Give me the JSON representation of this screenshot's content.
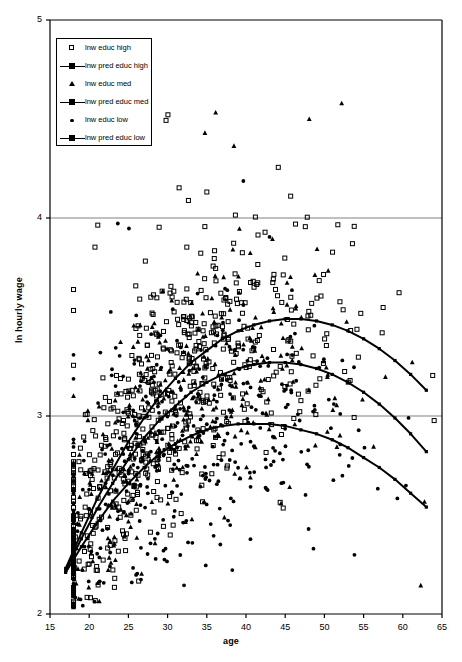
{
  "chart_data": {
    "type": "scatter",
    "title": "",
    "xlabel": "age",
    "ylabel": "ln hourly wage",
    "xlim": [
      15,
      65
    ],
    "ylim": [
      2,
      5
    ],
    "xticks": [
      15,
      20,
      25,
      30,
      35,
      40,
      45,
      50,
      55,
      60,
      65
    ],
    "yticks": [
      2,
      3,
      4,
      5
    ],
    "grid": "horizontal",
    "gridlines_y": [
      3,
      4
    ],
    "legend_position": "top-left",
    "legend": [
      {
        "label": "lnw educ high",
        "marker": "open-square",
        "type": "scatter"
      },
      {
        "label": "lnw pred educ high",
        "marker": "line-square",
        "type": "line"
      },
      {
        "label": "lnw educ med",
        "marker": "filled-triangle",
        "type": "scatter"
      },
      {
        "label": "lnw pred educ med",
        "marker": "line-square",
        "type": "line"
      },
      {
        "label": "lnw educ low",
        "marker": "filled-circle",
        "type": "scatter"
      },
      {
        "label": "lnw pred educ low",
        "marker": "line-square",
        "type": "line"
      }
    ],
    "series": [
      {
        "name": "lnw pred educ high",
        "type": "line",
        "x": [
          17,
          19,
          21,
          23,
          25,
          27,
          29,
          31,
          33,
          35,
          37,
          39,
          41,
          43,
          45,
          47,
          49,
          51,
          53,
          55,
          57,
          59,
          61,
          63
        ],
        "y": [
          2.23,
          2.41,
          2.58,
          2.73,
          2.87,
          2.99,
          3.1,
          3.19,
          3.27,
          3.33,
          3.39,
          3.43,
          3.46,
          3.48,
          3.49,
          3.49,
          3.48,
          3.46,
          3.43,
          3.39,
          3.34,
          3.28,
          3.21,
          3.13
        ]
      },
      {
        "name": "lnw pred educ med",
        "type": "line",
        "x": [
          17,
          19,
          21,
          23,
          25,
          27,
          29,
          31,
          33,
          35,
          37,
          39,
          41,
          43,
          45,
          47,
          49,
          51,
          53,
          55,
          57,
          59,
          61,
          63
        ],
        "y": [
          2.22,
          2.38,
          2.53,
          2.66,
          2.78,
          2.89,
          2.98,
          3.05,
          3.12,
          3.17,
          3.21,
          3.24,
          3.26,
          3.27,
          3.27,
          3.26,
          3.24,
          3.21,
          3.17,
          3.12,
          3.06,
          2.99,
          2.91,
          2.82
        ]
      },
      {
        "name": "lnw pred educ low",
        "type": "line",
        "x": [
          17,
          19,
          21,
          23,
          25,
          27,
          29,
          31,
          33,
          35,
          37,
          39,
          41,
          43,
          45,
          47,
          49,
          51,
          53,
          55,
          57,
          59,
          61,
          63
        ],
        "y": [
          2.21,
          2.34,
          2.46,
          2.57,
          2.66,
          2.74,
          2.81,
          2.86,
          2.9,
          2.93,
          2.95,
          2.96,
          2.96,
          2.96,
          2.95,
          2.93,
          2.91,
          2.88,
          2.84,
          2.79,
          2.74,
          2.68,
          2.61,
          2.54
        ]
      },
      {
        "name": "lnw educ high",
        "type": "scatter",
        "marker": "open-square",
        "n_points": 620,
        "mean_curve": "lnw pred educ high",
        "spread": 0.3,
        "x_range": [
          18,
          64
        ]
      },
      {
        "name": "lnw educ med",
        "type": "scatter",
        "marker": "filled-triangle",
        "n_points": 340,
        "mean_curve": "lnw pred educ med",
        "spread": 0.3,
        "x_range": [
          18,
          64
        ]
      },
      {
        "name": "lnw educ low",
        "type": "scatter",
        "marker": "filled-circle",
        "n_points": 430,
        "mean_curve": "lnw pred educ low",
        "spread": 0.3,
        "x_range": [
          18,
          64
        ]
      }
    ]
  },
  "axes": {
    "x_tick_labels": [
      "15",
      "20",
      "25",
      "30",
      "35",
      "40",
      "45",
      "50",
      "55",
      "60",
      "65"
    ],
    "y_tick_labels": [
      "2",
      "3",
      "4",
      "5"
    ],
    "x_title": "age",
    "y_title": "ln hourly wage"
  },
  "colors": {
    "background": "#ffffff",
    "axis": "#000000",
    "gridline": "#808080",
    "marker": "#000000",
    "curve": "#000000"
  }
}
